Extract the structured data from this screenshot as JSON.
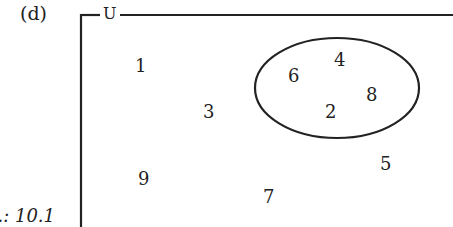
{
  "diagram": {
    "part_label": "(d)",
    "universal_set_label": "U",
    "figure_caption_fragment": "...: 10.1",
    "set_A": {
      "shape": "ellipse",
      "elements": [
        "6",
        "4",
        "2",
        "8"
      ]
    },
    "outside_elements": [
      "1",
      "3",
      "9",
      "7",
      "5"
    ],
    "elements": [
      {
        "value": "1",
        "x": 135,
        "y": 57
      },
      {
        "value": "3",
        "x": 203,
        "y": 103
      },
      {
        "value": "9",
        "x": 138,
        "y": 170
      },
      {
        "value": "7",
        "x": 263,
        "y": 188
      },
      {
        "value": "6",
        "x": 288,
        "y": 67
      },
      {
        "value": "4",
        "x": 334,
        "y": 51
      },
      {
        "value": "8",
        "x": 366,
        "y": 86
      },
      {
        "value": "2",
        "x": 325,
        "y": 103
      },
      {
        "value": "5",
        "x": 380,
        "y": 155
      }
    ],
    "colors": {
      "stroke": "#222222",
      "background": "#ffffff"
    }
  }
}
